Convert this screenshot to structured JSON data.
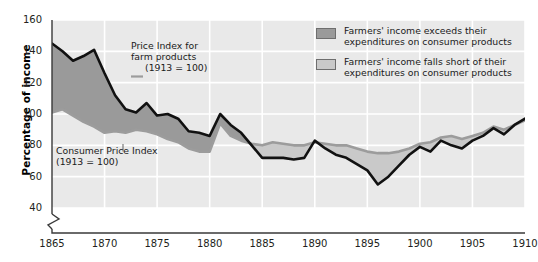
{
  "chart_data": {
    "type": "area",
    "title": "",
    "subtitle": "",
    "xlabel": "",
    "ylabel": "Percentage of income",
    "xlim": [
      1865,
      1910
    ],
    "ylim": [
      40,
      160
    ],
    "y_axis_break": true,
    "grid": true,
    "y_ticks": [
      40,
      60,
      80,
      100,
      120,
      140,
      160
    ],
    "x_ticks": [
      1865,
      1870,
      1875,
      1880,
      1885,
      1890,
      1895,
      1900,
      1905,
      1910
    ],
    "x": [
      1865,
      1866,
      1867,
      1868,
      1869,
      1870,
      1871,
      1872,
      1873,
      1874,
      1875,
      1876,
      1877,
      1878,
      1879,
      1880,
      1881,
      1882,
      1883,
      1884,
      1885,
      1886,
      1887,
      1888,
      1889,
      1890,
      1891,
      1892,
      1893,
      1894,
      1895,
      1896,
      1897,
      1898,
      1899,
      1900,
      1901,
      1902,
      1903,
      1904,
      1905,
      1906,
      1907,
      1908,
      1909,
      1910
    ],
    "series": [
      {
        "name": "Price Index for farm products (1913 = 100)",
        "color": "#111111",
        "values": [
          145,
          140,
          134,
          137,
          141,
          126,
          112,
          103,
          101,
          107,
          99,
          100,
          97,
          89,
          88,
          86,
          100,
          93,
          88,
          80,
          72,
          72,
          72,
          71,
          72,
          83,
          78,
          74,
          72,
          68,
          64,
          55,
          60,
          67,
          74,
          79,
          76,
          83,
          80,
          78,
          83,
          86,
          91,
          87,
          93,
          97
        ]
      },
      {
        "name": "Consumer Price Index (1913 = 100)",
        "color": "#9c9c9c",
        "values": [
          101,
          103,
          99,
          95,
          92,
          88,
          89,
          88,
          90,
          89,
          87,
          84,
          82,
          78,
          76,
          76,
          94,
          86,
          83,
          81,
          80,
          82,
          81,
          80,
          80,
          82,
          81,
          80,
          80,
          78,
          76,
          75,
          75,
          76,
          78,
          81,
          82,
          85,
          86,
          84,
          86,
          88,
          92,
          90,
          93,
          96
        ]
      }
    ],
    "fills": [
      {
        "name": "Farmers' income exceeds their expenditures on consumer products",
        "color": "#9a9a9a",
        "condition": "farm-above-cpi"
      },
      {
        "name": "Farmers' income falls short of their expenditures on consumer products",
        "color": "#c9c9c9",
        "condition": "farm-below-cpi"
      }
    ],
    "annotations": [
      {
        "id": "farm-annotation",
        "lines": [
          "Price Index for",
          "farm products",
          "(1913 = 100)"
        ],
        "leader": "dash"
      },
      {
        "id": "cpi-annotation",
        "lines": [
          "Consumer Price Index",
          "(1913 = 100)"
        ],
        "leader": "vertical-line"
      }
    ],
    "legend": {
      "position": "top-right",
      "entries": [
        {
          "swatch_color": "#9a9a9a",
          "lines": [
            "Farmers' income exceeds their",
            "expenditures on consumer products"
          ]
        },
        {
          "swatch_color": "#c9c9c9",
          "lines": [
            "Farmers' income falls short of their",
            "expenditures on consumer products"
          ]
        }
      ]
    },
    "colors": {
      "plot_background": "#e9e9e9",
      "gridline": "#ffffff",
      "axis": "#3a3a3a",
      "fill_above": "#9a9a9a",
      "fill_below": "#c9c9c9",
      "farm_line": "#111111",
      "cpi_line": "#9c9c9c"
    }
  },
  "axis": {
    "y_label": "Percentage of income",
    "y_ticks": [
      "160",
      "140",
      "120",
      "100",
      "80",
      "60",
      "40"
    ],
    "x_ticks": [
      "1865",
      "1870",
      "1875",
      "1880",
      "1885",
      "1890",
      "1895",
      "1900",
      "1905",
      "1910"
    ]
  },
  "annotations": {
    "farm": {
      "line1": "Price Index for",
      "line2": "farm products",
      "line3": "(1913 = 100)"
    },
    "cpi": {
      "line1": "Consumer Price Index",
      "line2": "(1913 = 100)"
    }
  },
  "legend": {
    "entry1": {
      "line1": "Farmers' income exceeds their",
      "line2": "expenditures on consumer products"
    },
    "entry2": {
      "line1": "Farmers' income falls short of their",
      "line2": "expenditures on consumer products"
    }
  }
}
